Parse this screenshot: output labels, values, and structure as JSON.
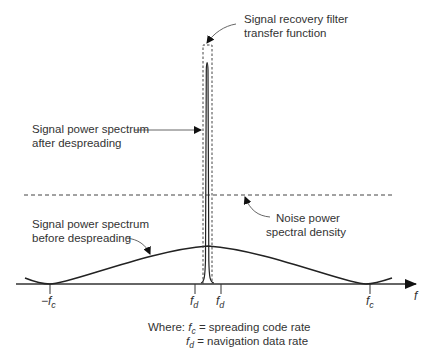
{
  "labels": {
    "filter_line1": "Signal recovery filter",
    "filter_line2": "transfer function",
    "after_line1": "Signal power spectrum",
    "after_line2": "after despreading",
    "before_line1": "Signal power spectrum",
    "before_line2": "before despreading",
    "noise_line1": "Noise power",
    "noise_line2": "spectral density"
  },
  "axis": {
    "label": "f",
    "ticks": [
      {
        "base": "−f",
        "sub": "c"
      },
      {
        "base": "f",
        "sub": "d"
      },
      {
        "base": "f",
        "sub": "d"
      },
      {
        "base": "f",
        "sub": "c"
      }
    ]
  },
  "legend": {
    "prefix": "Where: ",
    "row1_base": "f",
    "row1_sub": "c",
    "row1_text": " = spreading code rate",
    "row2_base": "f",
    "row2_sub": "d",
    "row2_text": " = navigation data rate"
  },
  "colors": {
    "line": "#222222",
    "dashed": "#444444"
  }
}
